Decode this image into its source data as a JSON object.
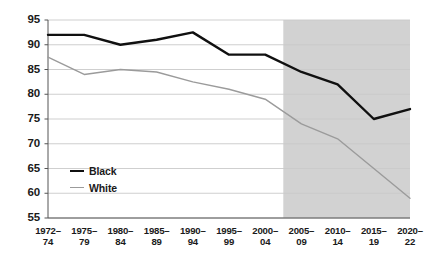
{
  "chart_data": {
    "type": "line",
    "title": "",
    "subtitle": "",
    "xlabel": "",
    "ylabel": "",
    "categories": [
      "1972–\n74",
      "1975–\n79",
      "1980–\n84",
      "1985–\n89",
      "1990–\n94",
      "1995–\n99",
      "2000–\n04",
      "2005–\n09",
      "2010–\n14",
      "2015–\n19",
      "2020–\n22"
    ],
    "series": [
      {
        "name": "Black",
        "color": "#101010",
        "values": [
          92,
          92,
          90,
          91,
          92.5,
          88,
          88,
          84.5,
          82,
          75,
          77
        ]
      },
      {
        "name": "White",
        "color": "#9b9b9b",
        "values": [
          87.5,
          84,
          85,
          84.5,
          82.5,
          81,
          79,
          74,
          71,
          65,
          59
        ]
      }
    ],
    "ylim": [
      55,
      95
    ],
    "ytick_values": [
      55,
      60,
      65,
      70,
      75,
      80,
      85,
      90,
      95
    ],
    "ytick_labels": [
      "55",
      "60",
      "65",
      "70",
      "75",
      "80",
      "85",
      "90",
      "95"
    ],
    "grid": true,
    "grid_color": "#c9c9c9",
    "legend_position": "inside-lower-left",
    "shaded_region": {
      "from_category": "2005–\n09",
      "to_category": "2020–\n22",
      "color": "#d2d2d2"
    },
    "background_color": "#ffffff"
  },
  "legend": {
    "entries": [
      {
        "label": "Black"
      },
      {
        "label": "White"
      }
    ]
  }
}
